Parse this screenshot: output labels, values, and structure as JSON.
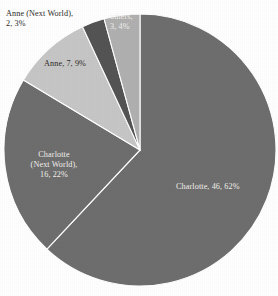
{
  "chart_data": {
    "type": "pie",
    "title": "",
    "legend_position": "labels-on-slices",
    "grid": false,
    "total": 74,
    "categories": [
      "Charlotte",
      "Charlotte (Next World)",
      "Anne",
      "Anne (Next World)",
      "others"
    ],
    "values": [
      46,
      16,
      7,
      2,
      3
    ],
    "percentages": [
      62,
      22,
      9,
      3,
      4
    ],
    "colors": [
      "#6e6e6e",
      "#6e6e6e",
      "#c6c6c6",
      "#545454",
      "#b0b0b0"
    ],
    "slices": [
      {
        "name": "Charlotte",
        "value": 46,
        "percent": 62,
        "label": "Charlotte, 46, 62%",
        "color": "#6e6e6e",
        "start_angle": 0,
        "end_angle": 223.2,
        "label_color": "light"
      },
      {
        "name": "Charlotte (Next World)",
        "value": 16,
        "percent": 22,
        "label_line1": "Charlotte",
        "label_line2": "(Next World),",
        "label_line3": "16, 22%",
        "color": "#6e6e6e",
        "start_angle": 223.2,
        "end_angle": 301.0,
        "label_color": "light"
      },
      {
        "name": "Anne",
        "value": 7,
        "percent": 9,
        "label": "Anne, 7, 9%",
        "color": "#c6c6c6",
        "start_angle": 301.0,
        "end_angle": 335.0,
        "label_color": "dark"
      },
      {
        "name": "Anne (Next World)",
        "value": 2,
        "percent": 3,
        "label_line1": "Anne (Next World),",
        "label_line2": "2, 3%",
        "color": "#545454",
        "start_angle": 335.0,
        "end_angle": 344.7,
        "label_color": "dark"
      },
      {
        "name": "others",
        "value": 3,
        "percent": 4,
        "label_line1": "others,",
        "label_line2": "3, 4%",
        "color": "#b0b0b0",
        "start_angle": 344.7,
        "end_angle": 360.0,
        "label_color": "light"
      }
    ],
    "background_color": "#ffffff"
  }
}
